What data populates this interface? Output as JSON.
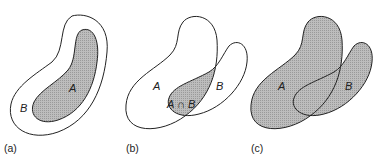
{
  "figure": {
    "panels": [
      {
        "caption": "(a)",
        "label_a": "A",
        "label_b": "B",
        "description": "A is a subset of B"
      },
      {
        "caption": "(b)",
        "label_a": "A",
        "label_b": "B",
        "label_intersection": "A ∩ B",
        "description": "Intersection of A and B shaded"
      },
      {
        "caption": "(c)",
        "label_a": "A",
        "label_b": "B",
        "description": "Union of A and B shaded"
      }
    ],
    "colors": {
      "shade": "#b8b8b8",
      "stroke": "#222222",
      "background": "#ffffff"
    }
  }
}
